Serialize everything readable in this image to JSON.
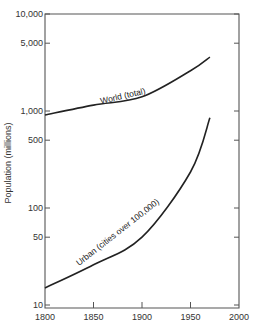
{
  "chart_data": {
    "type": "line",
    "title": "",
    "xlabel": "",
    "ylabel": "Population (millions)",
    "yscale": "log",
    "xlim": [
      1800,
      2000
    ],
    "ylim": [
      10,
      10000
    ],
    "grid": false,
    "legend": "inline labels along curves",
    "x_ticks": [
      "1800",
      "1850",
      "1900",
      "1950",
      "2000"
    ],
    "y_ticks": [
      "10",
      "50",
      "100",
      "500",
      "1,000",
      "5,000",
      "10,000"
    ],
    "series": [
      {
        "name": "World (total)",
        "x": [
          1800,
          1850,
          1900,
          1950,
          1970
        ],
        "values": [
          910,
          1150,
          1400,
          2600,
          3600
        ]
      },
      {
        "name": "Urban (cities over 100,000)",
        "x": [
          1800,
          1850,
          1900,
          1950,
          1970
        ],
        "values": [
          15,
          26,
          50,
          235,
          850
        ]
      }
    ]
  },
  "colors": {
    "line": "#222222",
    "axis": "#555555",
    "background": "#ffffff"
  }
}
